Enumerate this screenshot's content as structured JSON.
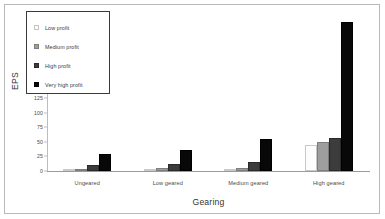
{
  "chart_data": {
    "type": "bar",
    "title": "",
    "subtitle": "",
    "xlabel": "Gearing",
    "ylabel": "EPS",
    "categories": [
      "Ungeared",
      "Low geared",
      "Medium geared",
      "High geared"
    ],
    "series": [
      {
        "name": "Low profit",
        "values": [
          1,
          1,
          1,
          45
        ],
        "color": "#fdfdfd"
      },
      {
        "name": "Medium profit",
        "values": [
          4,
          5,
          5,
          50
        ],
        "color": "#9e9e9e"
      },
      {
        "name": "High profit",
        "values": [
          10,
          12,
          16,
          57
        ],
        "color": "#3c3c3c"
      },
      {
        "name": "Very high profit",
        "values": [
          30,
          37,
          56,
          257
        ],
        "color": "#080808"
      }
    ],
    "ylim": [
      0,
      262
    ],
    "yticks": [
      0,
      25,
      50,
      75,
      100,
      125,
      150,
      175,
      200,
      225,
      250
    ],
    "ytick_labels": [
      "0",
      "25",
      "50",
      "75",
      "100",
      "125",
      "150",
      "175",
      "200",
      "225",
      "250"
    ],
    "grid": false,
    "legend_position": "upper-left-inside",
    "legend_entries": [
      "Low profit",
      "Medium profit",
      "High profit",
      "Very high profit"
    ],
    "background_color": "#ffffff",
    "border_color": "#b9b9b9",
    "axis_color": "#9a9a9a"
  }
}
